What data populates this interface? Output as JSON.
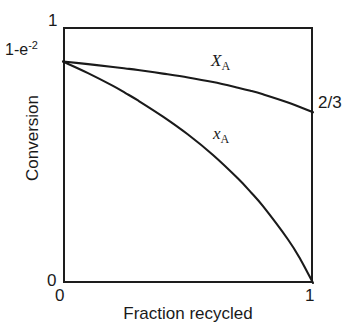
{
  "chart_data": {
    "type": "line",
    "title": "",
    "xlabel": "Fraction recycled",
    "ylabel": "Conversion",
    "xlim": [
      0,
      1
    ],
    "ylim": [
      0,
      1
    ],
    "grid": false,
    "legend_position": "inline-curve-labels",
    "x_ticks": [
      {
        "value": 0,
        "label": "0"
      },
      {
        "value": 1,
        "label": "1"
      }
    ],
    "y_ticks": [
      {
        "value": 1,
        "label": "1"
      },
      {
        "value": 0.8647,
        "label": "1-e",
        "superscript": "-2"
      },
      {
        "value": 0,
        "label": "0"
      }
    ],
    "annotations": [
      {
        "name": "right-endpoint-value",
        "text": "2/3",
        "x": 1,
        "y": 0.6667
      }
    ],
    "series": [
      {
        "name": "X_A",
        "label_main": "X",
        "label_sub": "A",
        "description": "Overall conversion, gently decreasing from 1-e^-2 to 2/3",
        "x": [
          0,
          0.1,
          0.2,
          0.25,
          0.3,
          0.4,
          0.5,
          0.6,
          0.7,
          0.75,
          0.8,
          0.9,
          1.0
        ],
        "y": [
          0.865,
          0.855,
          0.844,
          0.838,
          0.832,
          0.818,
          0.803,
          0.785,
          0.763,
          0.751,
          0.737,
          0.705,
          0.667
        ]
      },
      {
        "name": "x_A",
        "label_main": "x",
        "label_sub": "A",
        "description": "Single-pass conversion, strongly decreasing from 1-e^-2 to 0",
        "x": [
          0,
          0.1,
          0.2,
          0.25,
          0.3,
          0.4,
          0.5,
          0.6,
          0.7,
          0.75,
          0.8,
          0.9,
          0.95,
          1.0
        ],
        "y": [
          0.865,
          0.82,
          0.77,
          0.742,
          0.713,
          0.65,
          0.58,
          0.5,
          0.408,
          0.356,
          0.3,
          0.17,
          0.092,
          0.0
        ]
      }
    ]
  },
  "axis": {
    "y_top_label": "1",
    "y_mid_base": "1-e",
    "y_mid_exp": "-2",
    "y_bottom_label": "0",
    "x_left_label": "0",
    "x_right_label": "1",
    "x_axis_title": "Fraction recycled",
    "y_axis_title": "Conversion"
  },
  "labels": {
    "upper_curve_main": "X",
    "upper_curve_sub": "A",
    "lower_curve_main": "x",
    "lower_curve_sub": "A",
    "right_annotation": "2/3"
  },
  "colors": {
    "background": "#ffffff",
    "axis": "#1d1d1d",
    "curve": "#1a1a1a",
    "text": "#1a1a1a"
  }
}
